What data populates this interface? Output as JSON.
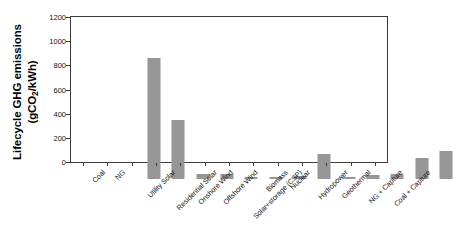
{
  "chart_data": {
    "type": "bar",
    "title": "",
    "xlabel": "",
    "ylabel": "Lifecycle GHG emissions (gCO2/kWh)",
    "ylabel_line1": "Lifecycle GHG emissions",
    "ylabel_line2_prefix": "(gCO",
    "ylabel_line2_sub": "2",
    "ylabel_line2_suffix": "/kWh)",
    "ylim": [
      0,
      1200
    ],
    "ytick_step": 200,
    "yticks": [
      "0",
      "200",
      "400",
      "600",
      "800",
      "1000",
      "1200"
    ],
    "ytick_values": [
      0,
      200,
      400,
      600,
      800,
      1000,
      1200
    ],
    "grid": false,
    "legend": "none",
    "bar_color": "#969696",
    "axis_color": "#3a3a3a",
    "categories": [
      "Coal",
      "NG",
      "Utility Solar",
      "Residential Solar",
      "Onshore Wind",
      "Offshore Wind",
      "Solar+storage (CSP)",
      "Biomass",
      "Nuclear",
      "Hydropower",
      "Geothermal",
      "NG + Capture",
      "Coal + Capture"
    ],
    "values": [
      1000,
      490,
      45,
      45,
      15,
      15,
      25,
      205,
      15,
      35,
      40,
      170,
      230
    ]
  }
}
